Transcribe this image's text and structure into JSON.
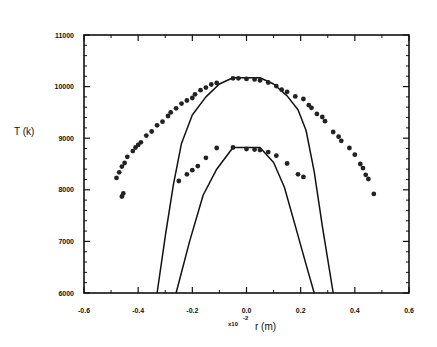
{
  "chart_data": {
    "type": "scatter",
    "title": "",
    "xlabel": "r (m)",
    "x_multiplier": "x10",
    "x_multiplier_exp": "-2",
    "ylabel": "T (k)",
    "xlim": [
      -0.6,
      0.6
    ],
    "ylim": [
      6000,
      11000
    ],
    "grid": false,
    "legend": null,
    "xticks": [
      -0.6,
      -0.4,
      -0.2,
      0.0,
      0.2,
      0.4,
      0.6
    ],
    "xtick_labels": [
      "-0.6",
      "-0.4",
      "-0.2",
      "0.0",
      "0.2",
      "0.4",
      "0.6"
    ],
    "yticks": [
      6000,
      7000,
      8000,
      9000,
      10000,
      11000
    ],
    "ytick_labels": [
      "6000",
      "7000",
      "8000",
      "9000",
      "10000",
      "11000"
    ],
    "series": [
      {
        "name": "upper-measured",
        "kind": "points",
        "points": [
          [
            -0.48,
            8230
          ],
          [
            -0.47,
            8340
          ],
          [
            -0.46,
            8450
          ],
          [
            -0.45,
            8520
          ],
          [
            -0.44,
            8640
          ],
          [
            -0.42,
            8750
          ],
          [
            -0.41,
            8820
          ],
          [
            -0.4,
            8870
          ],
          [
            -0.39,
            8920
          ],
          [
            -0.37,
            9050
          ],
          [
            -0.35,
            9130
          ],
          [
            -0.33,
            9250
          ],
          [
            -0.31,
            9320
          ],
          [
            -0.29,
            9430
          ],
          [
            -0.28,
            9500
          ],
          [
            -0.26,
            9580
          ],
          [
            -0.24,
            9670
          ],
          [
            -0.22,
            9730
          ],
          [
            -0.2,
            9780
          ],
          [
            -0.19,
            9850
          ],
          [
            -0.17,
            9930
          ],
          [
            -0.15,
            9980
          ],
          [
            -0.13,
            10040
          ],
          [
            -0.11,
            10070
          ],
          [
            -0.05,
            10160
          ],
          [
            -0.03,
            10160
          ],
          [
            0.0,
            10150
          ],
          [
            0.03,
            10140
          ],
          [
            0.05,
            10120
          ],
          [
            0.08,
            10080
          ],
          [
            0.11,
            10010
          ],
          [
            0.13,
            9940
          ],
          [
            0.15,
            9900
          ],
          [
            0.18,
            9810
          ],
          [
            0.21,
            9760
          ],
          [
            0.23,
            9640
          ],
          [
            0.24,
            9590
          ],
          [
            0.26,
            9470
          ],
          [
            0.28,
            9410
          ],
          [
            0.29,
            9330
          ],
          [
            0.32,
            9120
          ],
          [
            0.34,
            9030
          ],
          [
            0.35,
            8950
          ],
          [
            0.38,
            8810
          ],
          [
            0.4,
            8680
          ],
          [
            0.42,
            8500
          ],
          [
            0.43,
            8420
          ],
          [
            0.44,
            8290
          ],
          [
            0.45,
            8210
          ],
          [
            0.47,
            7920
          ]
        ]
      },
      {
        "name": "upper-extra",
        "kind": "points",
        "points": [
          [
            -0.46,
            7870
          ],
          [
            -0.455,
            7930
          ]
        ]
      },
      {
        "name": "lower-measured",
        "kind": "points",
        "points": [
          [
            -0.25,
            8170
          ],
          [
            -0.22,
            8300
          ],
          [
            -0.2,
            8380
          ],
          [
            -0.18,
            8460
          ],
          [
            -0.15,
            8620
          ],
          [
            -0.11,
            8810
          ],
          [
            -0.05,
            8820
          ],
          [
            0.0,
            8790
          ],
          [
            0.03,
            8780
          ],
          [
            0.05,
            8770
          ],
          [
            0.08,
            8730
          ],
          [
            0.11,
            8660
          ],
          [
            0.15,
            8510
          ],
          [
            0.19,
            8300
          ],
          [
            0.21,
            8250
          ]
        ]
      },
      {
        "name": "outer-model",
        "kind": "line",
        "points": [
          [
            -0.33,
            6000
          ],
          [
            -0.3,
            7100
          ],
          [
            -0.27,
            8100
          ],
          [
            -0.24,
            8900
          ],
          [
            -0.2,
            9450
          ],
          [
            -0.15,
            9800
          ],
          [
            -0.1,
            10050
          ],
          [
            -0.05,
            10170
          ],
          [
            0.05,
            10170
          ],
          [
            0.1,
            10050
          ],
          [
            0.15,
            9820
          ],
          [
            0.19,
            9550
          ],
          [
            0.22,
            9150
          ],
          [
            0.25,
            8350
          ],
          [
            0.28,
            7300
          ],
          [
            0.32,
            6000
          ]
        ]
      },
      {
        "name": "inner-model",
        "kind": "line",
        "points": [
          [
            -0.26,
            6000
          ],
          [
            -0.21,
            7000
          ],
          [
            -0.16,
            7900
          ],
          [
            -0.11,
            8400
          ],
          [
            -0.05,
            8820
          ],
          [
            0.05,
            8820
          ],
          [
            0.1,
            8530
          ],
          [
            0.14,
            8050
          ],
          [
            0.18,
            7300
          ],
          [
            0.22,
            6550
          ],
          [
            0.25,
            6000
          ]
        ]
      }
    ]
  },
  "style": {
    "ink": "#111111",
    "background": "#ffffff",
    "plot_box": {
      "left": 84,
      "top": 35,
      "right": 409,
      "bottom": 293
    }
  }
}
